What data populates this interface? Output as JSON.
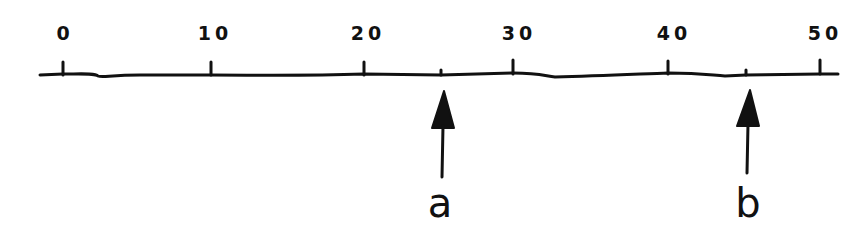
{
  "diagram": {
    "type": "number-line",
    "min": 0,
    "max": 50,
    "major_ticks": [
      {
        "value": 0,
        "label": "0",
        "x": 63
      },
      {
        "value": 10,
        "label": "10",
        "x": 211
      },
      {
        "value": 20,
        "label": "20",
        "x": 364
      },
      {
        "value": 30,
        "label": "30",
        "x": 513
      },
      {
        "value": 40,
        "label": "40",
        "x": 668
      },
      {
        "value": 50,
        "label": "50",
        "x": 820
      }
    ],
    "points": [
      {
        "label": "a",
        "approx_value": 25,
        "x": 441
      },
      {
        "label": "b",
        "approx_value": 45,
        "x": 746
      }
    ],
    "stroke_color": "#111111",
    "background": "#ffffff"
  }
}
